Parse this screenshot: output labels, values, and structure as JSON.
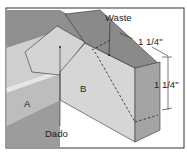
{
  "diagram": {
    "labels": {
      "waste": "Waste",
      "dado": "Dado",
      "part_a": "A",
      "part_b": "B",
      "dim_width": "1 1/4\"",
      "dim_height": "1 1/4\""
    },
    "colors": {
      "border": "#333333",
      "top_face": "#8a8a8a",
      "side_face": "#c8c8c8",
      "dark_face": "#9a9a9a",
      "light_face": "#d8d8d8",
      "line": "#222222"
    }
  }
}
